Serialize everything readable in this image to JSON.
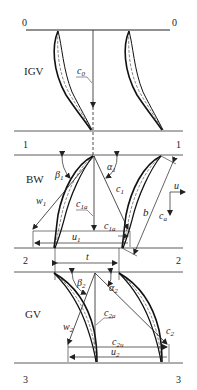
{
  "stations": {
    "s0_left": "0",
    "s0_right": "0",
    "s1_left": "1",
    "s1_right": "1",
    "s2_left": "2",
    "s2_right": "2",
    "s3_left": "3",
    "s3_right": "3"
  },
  "rows": {
    "igv": "IGV",
    "bw": "BW",
    "gv": "GV"
  },
  "vectors": {
    "c0": "c",
    "c0_sub": "0",
    "c1": "c",
    "c1_sub": "1",
    "c1a": "c",
    "c1a_sub": "1a",
    "c1a_b": "c",
    "c1a_b_sub": "1a",
    "w1": "w",
    "w1_sub": "1",
    "u1": "u",
    "u1_sub": "1",
    "w2": "w",
    "w2_sub": "2",
    "c2": "c",
    "c2_sub": "2",
    "c2a": "c",
    "c2a_sub": "2a",
    "c2u": "c",
    "c2u_sub": "2u",
    "u2": "u",
    "u2_sub": "2"
  },
  "angles": {
    "beta1": "β",
    "beta1_sub": "1",
    "alpha1": "α",
    "alpha1_sub": "1",
    "beta2": "β",
    "beta2_sub": "2",
    "alpha2": "α",
    "alpha2_sub": "2"
  },
  "dimensions": {
    "chord": "b",
    "pitch": "t"
  },
  "axes": {
    "u": "u",
    "ca": "c",
    "ca_sub": "a"
  }
}
